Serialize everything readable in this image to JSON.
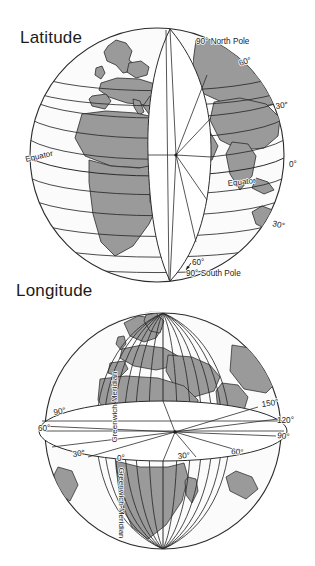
{
  "page": {
    "background_color": "#ffffff",
    "kind": "textbook-diagram-pair"
  },
  "palette": {
    "ink": "#1b1b1b",
    "line": "#2b2b2b",
    "land_fill": "#9a9a9a",
    "ocean_fill": "#fbfbfb",
    "wedge_fill": "#ffffff",
    "shadow": "#6e6e6e"
  },
  "figures": [
    {
      "id": "latitude",
      "title": "Latitude",
      "description": "Globe showing lines of latitude as horizontal circles, with a cut-away white wedge revealing angles measured from the Earth's centre.",
      "labels": [
        {
          "name": "north-pole",
          "text": "90° North Pole",
          "x": 196,
          "y": 44,
          "anchor": "start",
          "rotate": 0
        },
        {
          "name": "north-60",
          "text": "60°",
          "x": 240,
          "y": 66,
          "anchor": "start",
          "rotate": -18
        },
        {
          "name": "north-30",
          "text": "30°",
          "x": 276,
          "y": 109,
          "anchor": "start",
          "rotate": -8
        },
        {
          "name": "equator-right-degree",
          "text": "0°",
          "x": 289,
          "y": 167,
          "anchor": "start",
          "rotate": 0
        },
        {
          "name": "south-30",
          "text": "30°",
          "x": 272,
          "y": 226,
          "anchor": "start",
          "rotate": 12
        },
        {
          "name": "south-60",
          "text": "60°",
          "x": 192,
          "y": 265,
          "anchor": "start",
          "rotate": 0
        },
        {
          "name": "south-pole",
          "text": "90° South Pole",
          "x": 186,
          "y": 276,
          "anchor": "start",
          "rotate": 0
        },
        {
          "name": "equator-left",
          "text": "Equator",
          "x": 26,
          "y": 162,
          "anchor": "start",
          "rotate": -13
        },
        {
          "name": "equator-right",
          "text": "Equator",
          "x": 228,
          "y": 186,
          "anchor": "start",
          "rotate": -6
        }
      ]
    },
    {
      "id": "longitude",
      "title": "Longitude",
      "description": "Globe showing meridians of longitude converging at the poles, with a cut-away white equatorial disc revealing angles measured east and west of the Greenwich Meridian.",
      "labels": [
        {
          "name": "west-90",
          "text": "90°",
          "x": 54,
          "y": 144,
          "anchor": "start",
          "rotate": -10
        },
        {
          "name": "west-60",
          "text": "60°",
          "x": 38,
          "y": 160,
          "anchor": "start",
          "rotate": 0
        },
        {
          "name": "west-30",
          "text": "30°",
          "x": 73,
          "y": 186,
          "anchor": "start",
          "rotate": -8
        },
        {
          "name": "greenwich-zero",
          "text": "0°",
          "x": 117,
          "y": 190,
          "anchor": "start",
          "rotate": 0
        },
        {
          "name": "east-30",
          "text": "30°",
          "x": 178,
          "y": 188,
          "anchor": "start",
          "rotate": -6
        },
        {
          "name": "east-60",
          "text": "60°",
          "x": 231,
          "y": 183,
          "anchor": "start",
          "rotate": 4
        },
        {
          "name": "east-90",
          "text": "90°",
          "x": 277,
          "y": 167,
          "anchor": "start",
          "rotate": 6
        },
        {
          "name": "east-120",
          "text": "120°",
          "x": 277,
          "y": 152,
          "anchor": "start",
          "rotate": 0
        },
        {
          "name": "east-150",
          "text": "150°",
          "x": 262,
          "y": 136,
          "anchor": "start",
          "rotate": -8
        },
        {
          "name": "greenwich-meridian-upper",
          "text": "Greenwich Meridian",
          "x": 117,
          "y": 136,
          "anchor": "middle",
          "rotate": -90
        },
        {
          "name": "greenwich-meridian-lower",
          "text": "Greenwich Meridian",
          "x": 119,
          "y": 232,
          "anchor": "middle",
          "rotate": 90
        }
      ]
    }
  ]
}
